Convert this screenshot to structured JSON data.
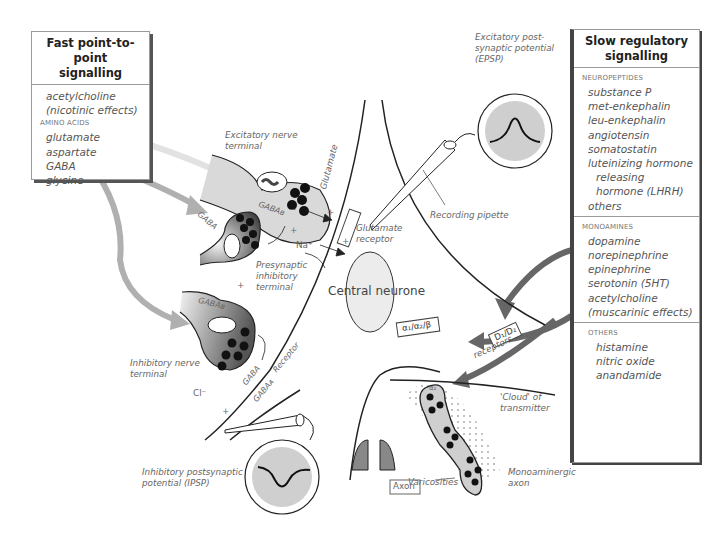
{
  "fast_box": {
    "title_line1": "Fast point-to-point",
    "title_line2": "signalling",
    "items_top": [
      "acetylcholine",
      "(nicotinic effects)"
    ],
    "category": "AMINO ACIDS",
    "amino_acids": [
      "glutamate",
      "aspartate",
      "GABA",
      "glycine"
    ]
  },
  "slow_box": {
    "title_line1": "Slow regulatory",
    "title_line2": "signalling",
    "neuropeptides_label": "NEUROPEPTIDES",
    "neuropeptides": [
      "substance P",
      "met-enkephalin",
      "leu-enkephalin",
      "angiotensin",
      "somatostatin",
      "luteinizing hormone"
    ],
    "neuropeptides_indent": [
      "releasing",
      "hormone (LHRH)"
    ],
    "neuropeptides_last": "others",
    "monoamines_label": "MONOAMINES",
    "monoamines": [
      "dopamine",
      "norepinephrine",
      "epinephrine",
      "serotonin (5HT)",
      "acetylcholine",
      "(muscarinic effects)"
    ],
    "others_label": "OTHERS",
    "others": [
      "histamine",
      "nitric oxide",
      "anandamide"
    ]
  },
  "labels": {
    "excitatory_terminal_1": "Excitatory nerve",
    "excitatory_terminal_2": "terminal",
    "presynaptic_1": "Presynaptic",
    "presynaptic_2": "inhibitory",
    "presynaptic_3": "terminal",
    "inhibitory_terminal_1": "Inhibitory nerve",
    "inhibitory_terminal_2": "terminal",
    "epsp_1": "Excitatory post-",
    "epsp_2": "synaptic potential",
    "epsp_3": "(EPSP)",
    "recording_pipette": "Recording pipette",
    "glutamate": "Glutamate",
    "glutamate_receptor_1": "Glutamate",
    "glutamate_receptor_2": "receptor",
    "na": "Na⁺",
    "cl": "Cl⁻",
    "central_neurone": "Central neurone",
    "gaba_b_top": "GABAʙ",
    "gaba_a": "GABAᴀ",
    "gaba": "GABA",
    "receptor": "Receptor",
    "alpha_receptors": "α₁/α₂/β",
    "d_receptors": "D₁/D₂",
    "receptors": "receptors",
    "alpha2": "α₂",
    "cloud_1": "'Cloud' of",
    "cloud_2": "transmitter",
    "varicosities": "Varicosities",
    "monoaminergic_1": "Monoaminergic",
    "monoaminergic_2": "axon",
    "axon": "Axon",
    "ipsp_1": "Inhibitory postsynaptic",
    "ipsp_2": "potential (IPSP)",
    "plus": "+",
    "minus": "−"
  },
  "colors": {
    "line": "#222222",
    "grey_fill": "#cfcfcf",
    "dark_fill": "#777777",
    "arrow_light": "#d8d8d8",
    "arrow_mid": "#9a9a9a",
    "arrow_dark": "#555555"
  }
}
